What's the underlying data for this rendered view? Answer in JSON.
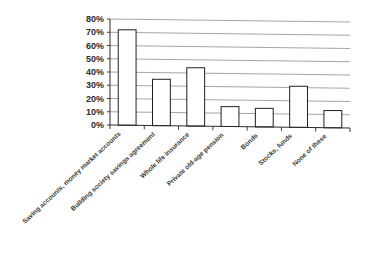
{
  "chart_data": {
    "type": "bar",
    "title": "",
    "subtitle": "",
    "xlabel": "",
    "ylabel": "",
    "ylim": [
      0,
      80
    ],
    "ytick_step": 10,
    "grid": true,
    "legend": false,
    "legend_position": "none",
    "orientation": "vertical",
    "categories": [
      "Saving accounts, money market accounts",
      "Building society savings agreement",
      "Whole life insurance",
      "Private old-age pension",
      "Bonds",
      "Stocks, funds",
      "None of these"
    ],
    "values": [
      72,
      35,
      44,
      15,
      14,
      31,
      13
    ],
    "value_labels": [
      "72%",
      "35%",
      "44%",
      "15%",
      "14%",
      "31%",
      "13%"
    ],
    "ytick_labels": [
      "0%",
      "10%",
      "20%",
      "30%",
      "40%",
      "50%",
      "60%",
      "70%",
      "80%"
    ],
    "ytick_values": [
      0,
      10,
      20,
      30,
      40,
      50,
      60,
      70,
      80
    ],
    "colors": {
      "bar_fill": "#ffffff",
      "bar_stroke": "#1f1f1f",
      "gridline": "#8e8e8e",
      "axis": "#2b2b2b",
      "tick_label": "#2b2b2b",
      "category_label": "#3a3a3a",
      "background": "#ffffff"
    }
  }
}
